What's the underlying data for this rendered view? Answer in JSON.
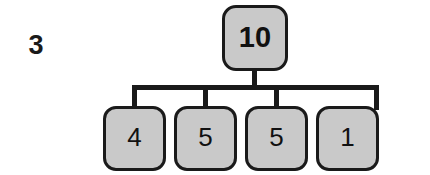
{
  "step_label": "3",
  "tree": {
    "root": {
      "value": "10",
      "name": "root-node"
    },
    "children": [
      {
        "value": "4"
      },
      {
        "value": "5"
      },
      {
        "value": "5"
      },
      {
        "value": "1"
      }
    ]
  },
  "colors": {
    "node_fill": "#c9c9c9",
    "node_border": "#1a1a1a",
    "edge": "#1a1a1a",
    "text": "#111111",
    "background": "#ffffff"
  }
}
